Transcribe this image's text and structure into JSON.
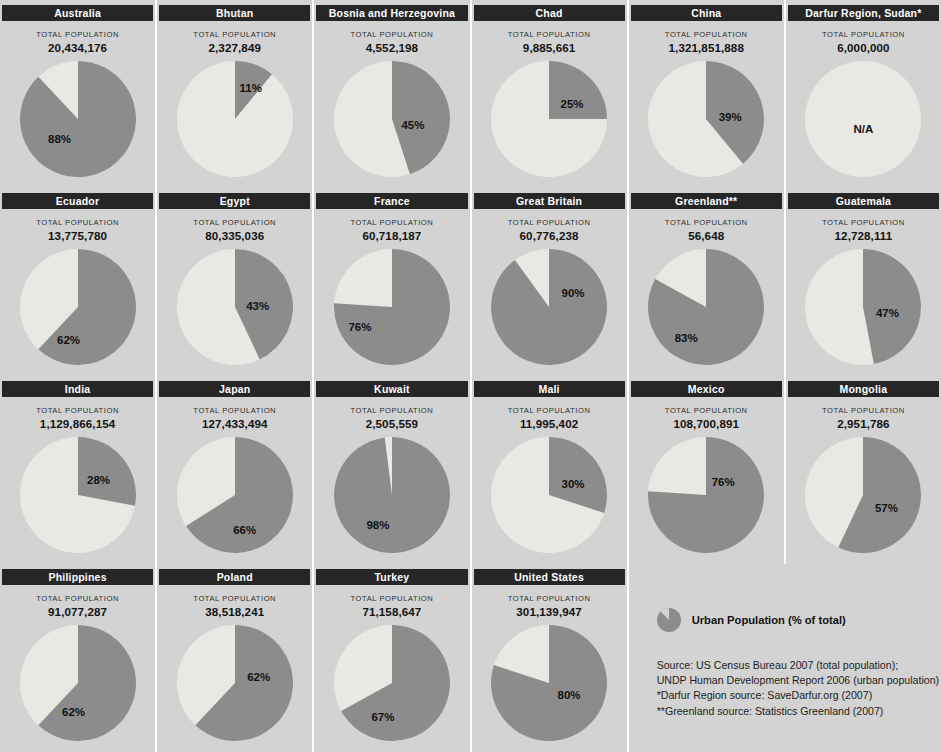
{
  "colors": {
    "urban": "#8c8c8c",
    "rural": "#e9e9e4",
    "header_bar": "#262626",
    "panel_bg": "#d3d3d3",
    "gutter": "#ffffff",
    "text": "#111111"
  },
  "labels": {
    "total_population": "TOTAL POPULATION",
    "na": "N/A"
  },
  "legend": {
    "swatch_name": "pie-slice-swatch",
    "text": "Urban Population (% of total)"
  },
  "sources": [
    "Source: US Census Bureau 2007 (total population);",
    "UNDP Human Development Report 2006 (urban population)",
    "*Darfur Region source: SaveDarfur.org (2007)",
    "**Greenland source: Statistics Greenland (2007)"
  ],
  "chart_data": {
    "type": "pie",
    "series_name": "Urban Population (% of total)",
    "value_key": "urban_pct",
    "slice_labels": [
      "Urban Population",
      "Remainder"
    ],
    "colors": [
      "#8c8c8c",
      "#e9e9e4"
    ],
    "legend_position": "bottom-right",
    "panels": [
      {
        "name": "Australia",
        "population": "20,434,176",
        "population_value": 20434176,
        "urban_pct": 88,
        "label": "88%",
        "label_x": 40,
        "label_y": 78
      },
      {
        "name": "Bhutan",
        "population": "2,327,849",
        "population_value": 2327849,
        "urban_pct": 11,
        "label": "11%",
        "label_x": 74,
        "label_y": 27
      },
      {
        "name": "Bosnia and Herzegovina",
        "population": "4,552,198",
        "population_value": 4552198,
        "urban_pct": 45,
        "label": "45%",
        "label_x": 79,
        "label_y": 64
      },
      {
        "name": "Chad",
        "population": "9,885,661",
        "population_value": 9885661,
        "urban_pct": 25,
        "label": "25%",
        "label_x": 81,
        "label_y": 43
      },
      {
        "name": "China",
        "population": "1,321,851,888",
        "population_value": 1321851888,
        "urban_pct": 39,
        "label": "39%",
        "label_x": 82,
        "label_y": 56
      },
      {
        "name": "Darfur Region, Sudan*",
        "population": "6,000,000",
        "population_value": 6000000,
        "urban_pct": null,
        "label": "N/A",
        "label_x": 58,
        "label_y": 68
      },
      {
        "name": "Ecuador",
        "population": "13,775,780",
        "population_value": 13775780,
        "urban_pct": 62,
        "label": "62%",
        "label_x": 49,
        "label_y": 91
      },
      {
        "name": "Egypt",
        "population": "80,335,036",
        "population_value": 80335036,
        "urban_pct": 43,
        "label": "43%",
        "label_x": 81,
        "label_y": 57
      },
      {
        "name": "France",
        "population": "60,718,187",
        "population_value": 60718187,
        "urban_pct": 76,
        "label": "76%",
        "label_x": 26,
        "label_y": 78
      },
      {
        "name": "Great Britain",
        "population": "60,776,238",
        "population_value": 60776238,
        "urban_pct": 90,
        "label": "90%",
        "label_x": 82,
        "label_y": 44
      },
      {
        "name": "Greenland**",
        "population": "56,648",
        "population_value": 56648,
        "urban_pct": 83,
        "label": "83%",
        "label_x": 38,
        "label_y": 89
      },
      {
        "name": "Guatemala",
        "population": "12,728,111",
        "population_value": 12728111,
        "urban_pct": 47,
        "label": "47%",
        "label_x": 82,
        "label_y": 64
      },
      {
        "name": "India",
        "population": "1,129,866,154",
        "population_value": 1129866154,
        "urban_pct": 28,
        "label": "28%",
        "label_x": 79,
        "label_y": 43
      },
      {
        "name": "Japan",
        "population": "127,433,494",
        "population_value": 127433494,
        "urban_pct": 66,
        "label": "66%",
        "label_x": 68,
        "label_y": 93
      },
      {
        "name": "Kuwait",
        "population": "2,505,559",
        "population_value": 2505559,
        "urban_pct": 98,
        "label": "98%",
        "label_x": 44,
        "label_y": 88
      },
      {
        "name": "Mali",
        "population": "11,995,402",
        "population_value": 11995402,
        "urban_pct": 30,
        "label": "30%",
        "label_x": 82,
        "label_y": 47
      },
      {
        "name": "Mexico",
        "population": "108,700,891",
        "population_value": 108700891,
        "urban_pct": 76,
        "label": "76%",
        "label_x": 75,
        "label_y": 45
      },
      {
        "name": "Mongolia",
        "population": "2,951,786",
        "population_value": 2951786,
        "urban_pct": 57,
        "label": "57%",
        "label_x": 81,
        "label_y": 71
      },
      {
        "name": "Philippines",
        "population": "91,077,287",
        "population_value": 91077287,
        "urban_pct": 62,
        "label": "62%",
        "label_x": 54,
        "label_y": 87
      },
      {
        "name": "Poland",
        "population": "38,518,241",
        "population_value": 38518241,
        "urban_pct": 62,
        "label": "62%",
        "label_x": 82,
        "label_y": 52
      },
      {
        "name": "Turkey",
        "population": "71,158,647",
        "population_value": 71158647,
        "urban_pct": 67,
        "label": "67%",
        "label_x": 49,
        "label_y": 92
      },
      {
        "name": "United States",
        "population": "301,139,947",
        "population_value": 301139947,
        "urban_pct": 80,
        "label": "80%",
        "label_x": 78,
        "label_y": 70
      }
    ]
  }
}
